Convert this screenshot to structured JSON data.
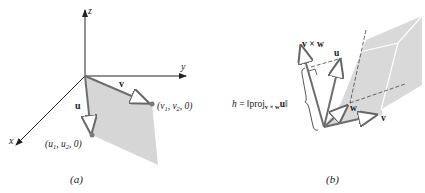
{
  "panel_a": {
    "caption": "(a)",
    "axes": {
      "x": "x",
      "y": "y",
      "z": "z"
    },
    "vectors": {
      "u": "u",
      "v": "v"
    },
    "points": {
      "u_point": {
        "pre": "(u",
        "sub1": "1",
        "mid": ", u",
        "sub2": "2",
        "post": ", 0)"
      },
      "v_point": {
        "pre": "(v",
        "sub1": "1",
        "mid": ", v",
        "sub2": "2",
        "post": ", 0)"
      }
    },
    "colors": {
      "fill": "#d6d6d6",
      "vector": "#6e6e6e",
      "point": "#7a7a7a"
    }
  },
  "panel_b": {
    "caption": "(b)",
    "vectors": {
      "u": "u",
      "v": "v",
      "w": "w",
      "cross": "v × w"
    },
    "height_label": {
      "h": "h",
      "eq": " = ‖proj",
      "sub": "v × w",
      "u": "u",
      "end": "‖"
    },
    "colors": {
      "fill": "#d9d9d9",
      "vector": "#6e6e6e",
      "edge": "#ffffff"
    }
  }
}
